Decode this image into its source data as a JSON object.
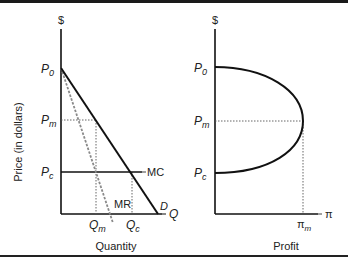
{
  "left_panel": {
    "y_axis_symbol": "$",
    "y_axis_title": "Price (in dollars)",
    "x_axis_symbol": "Q",
    "x_axis_title": "Quantity",
    "price_labels": {
      "p0": {
        "base": "P",
        "sub": "0"
      },
      "pm": {
        "base": "P",
        "sub": "m"
      },
      "pc": {
        "base": "P",
        "sub": "c"
      }
    },
    "quantity_labels": {
      "qm": {
        "base": "Q",
        "sub": "m"
      },
      "qc": {
        "base": "Q",
        "sub": "c"
      }
    },
    "curves": {
      "demand": "D",
      "marginal_revenue": "MR",
      "marginal_cost": "MC"
    }
  },
  "right_panel": {
    "y_axis_symbol": "$",
    "x_axis_symbol": "π",
    "x_axis_title": "Profit",
    "price_labels": {
      "p0": {
        "base": "P",
        "sub": "0"
      },
      "pm": {
        "base": "P",
        "sub": "m"
      },
      "pc": {
        "base": "P",
        "sub": "c"
      }
    },
    "profit_label": {
      "base": "π",
      "sub": "m"
    }
  },
  "colors": {
    "line": "#111111",
    "mr_dashed": "#8a8a8a",
    "guide_dotted": "#555555"
  }
}
